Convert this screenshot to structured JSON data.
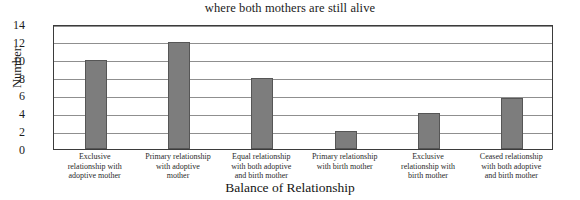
{
  "chart_data": {
    "type": "bar",
    "title": "where both mothers are still alive",
    "xlabel": "Balance of Relationship",
    "ylabel": "Number",
    "categories": [
      "Exclusive relationship with adoptive mother",
      "Primary relationship with adoptive mother",
      "Equal relationship with both adoptive and birth mother",
      "Primary relationship with birth mother",
      "Exclusive relationship with birth mother",
      "Ceased relationship with both adoptive and birth mother"
    ],
    "category_lines": [
      [
        "Exclusive",
        "relationship with",
        "adoptive mother"
      ],
      [
        "Primary relationship",
        "with adoptive",
        "mother"
      ],
      [
        "Equal relationship",
        "with both adoptive",
        "and birth mother"
      ],
      [
        "Primary relationship",
        "with birth mother"
      ],
      [
        "Exclusive",
        "relationship with",
        "birth mother"
      ],
      [
        "Ceased relationship",
        "with both adoptive",
        "and birth mother"
      ]
    ],
    "values": [
      10,
      12,
      8,
      2,
      4,
      5.7
    ],
    "ylim": [
      0,
      14
    ],
    "ytick_values": [
      0,
      2,
      4,
      6,
      8,
      10,
      12,
      14
    ],
    "ytick_labels": [
      "0",
      "2",
      "4",
      "6",
      "8",
      "10",
      "12",
      "14"
    ],
    "grid": true,
    "legend": false,
    "bar_color": "#7d7d7d",
    "bar_edge_color": "#565656",
    "grid_color": "#8f8f8f",
    "frame_color": "#3b3b3b",
    "background": "#ffffff"
  }
}
